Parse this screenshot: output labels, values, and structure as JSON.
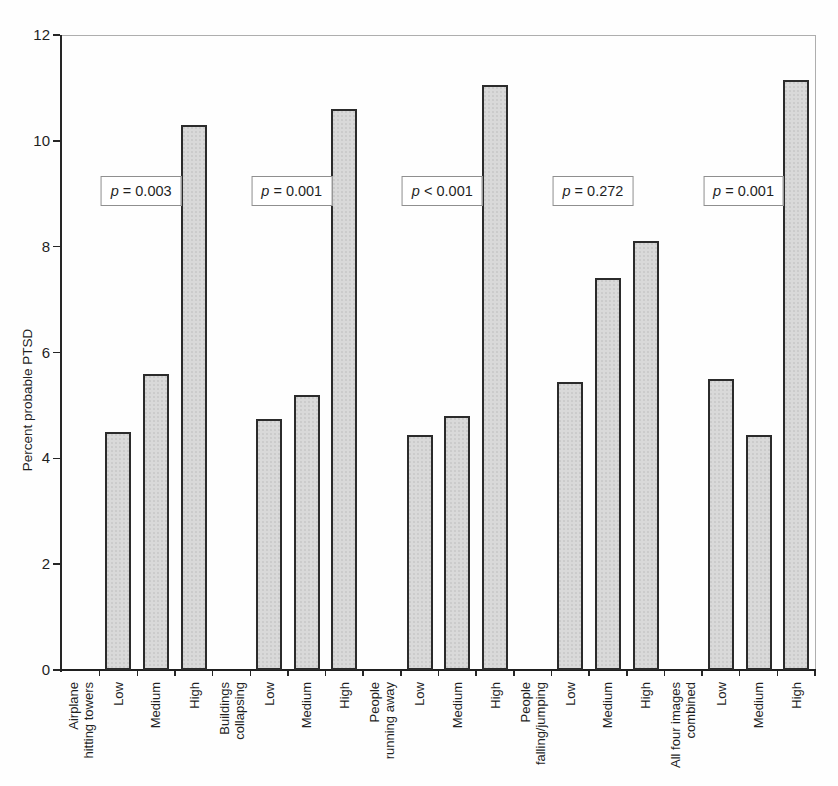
{
  "chart_data": {
    "type": "bar",
    "title": "",
    "ylabel": "Percent probable PTSD",
    "xlabel": "",
    "ylim": [
      0,
      12
    ],
    "yticks": [
      0,
      2,
      4,
      6,
      8,
      10,
      12
    ],
    "series_labels": [
      "Low",
      "Medium",
      "High"
    ],
    "legend_position": "none",
    "grid": "top-border-only",
    "groups": [
      {
        "category": "Airplane hitting towers",
        "category_lines": [
          "Airplane",
          "hitting towers"
        ],
        "p_label": "p = 0.003",
        "values": [
          4.5,
          5.6,
          10.3
        ]
      },
      {
        "category": "Buildings collapsing",
        "category_lines": [
          "Buildings",
          "collapsing"
        ],
        "p_label": "p = 0.001",
        "values": [
          4.75,
          5.2,
          10.6
        ]
      },
      {
        "category": "People running away",
        "category_lines": [
          "People",
          "running away"
        ],
        "p_label": "p < 0.001",
        "values": [
          4.45,
          4.8,
          11.05
        ]
      },
      {
        "category": "People falling/jumping",
        "category_lines": [
          "People",
          "falling/jumping"
        ],
        "p_label": "p = 0.272",
        "values": [
          5.45,
          7.4,
          8.1
        ]
      },
      {
        "category": "All four images combined",
        "category_lines": [
          "All four images",
          "combined"
        ],
        "p_label": "p = 0.001",
        "values": [
          5.5,
          4.45,
          11.15
        ]
      }
    ],
    "colors": {
      "bar_fill": "#d9d9d9",
      "bar_border": "#2b2b2b",
      "axis": "#262626",
      "plot_border": "#aeaeae",
      "text": "#1f1f1f",
      "p_box_border": "#8f8f8f",
      "background": "#fefefe"
    }
  }
}
